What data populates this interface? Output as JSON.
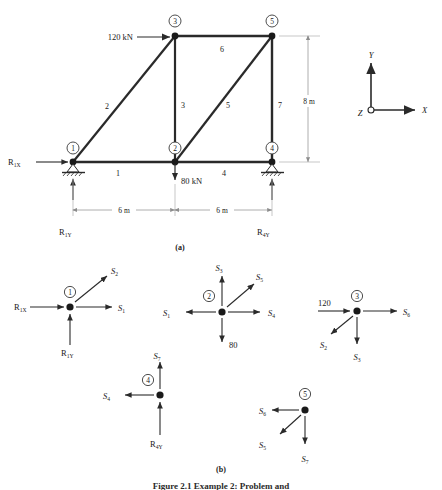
{
  "figure": {
    "panel_a_label": "(a)",
    "panel_b_label": "(b)",
    "caption": "Figure 2.1  Example 2: Problem and"
  },
  "truss": {
    "nodes": [
      {
        "id": "1",
        "label": "1",
        "x": 73,
        "y": 162,
        "support": "pin"
      },
      {
        "id": "2",
        "label": "2",
        "x": 175,
        "y": 162,
        "support": "none"
      },
      {
        "id": "3",
        "label": "3",
        "x": 175,
        "y": 36,
        "support": "none"
      },
      {
        "id": "4",
        "label": "4",
        "x": 272,
        "y": 162,
        "support": "roller"
      },
      {
        "id": "5",
        "label": "5",
        "x": 272,
        "y": 36,
        "support": "none"
      }
    ],
    "members": [
      {
        "label": "1",
        "from": "1",
        "to": "2",
        "lx": 118,
        "ly": 176
      },
      {
        "label": "2",
        "from": "1",
        "to": "3",
        "lx": 107,
        "ly": 109
      },
      {
        "label": "3",
        "from": "2",
        "to": "3",
        "lx": 182,
        "ly": 108
      },
      {
        "label": "4",
        "from": "2",
        "to": "4",
        "lx": 224,
        "ly": 176
      },
      {
        "label": "5",
        "from": "2",
        "to": "5",
        "lx": 227,
        "ly": 108
      },
      {
        "label": "6",
        "from": "3",
        "to": "5",
        "lx": 222,
        "ly": 51
      },
      {
        "label": "7",
        "from": "4",
        "to": "5",
        "lx": 279,
        "ly": 108
      }
    ],
    "loads": [
      {
        "name": "load-120",
        "text": "120 kN",
        "tx": 105,
        "ty": 41
      },
      {
        "name": "load-80",
        "text": "80 kN",
        "tx": 188,
        "ty": 182
      }
    ],
    "reactions": [
      {
        "name": "R1X",
        "base": "R",
        "sub": "1X",
        "tx": 8,
        "ty": 162
      },
      {
        "name": "R1Y",
        "base": "R",
        "sub": "1Y",
        "tx": 60,
        "ty": 232
      },
      {
        "name": "R4Y",
        "base": "R",
        "sub": "4Y",
        "tx": 258,
        "ty": 232
      }
    ],
    "dimensions": [
      {
        "name": "dim-span-left",
        "text": "6 m",
        "tx": 124,
        "ty": 215
      },
      {
        "name": "dim-span-right",
        "text": "6 m",
        "tx": 222,
        "ty": 215
      },
      {
        "name": "dim-height",
        "text": "8 m",
        "tx": 309,
        "ty": 102
      }
    ],
    "axes": {
      "x_label": "X",
      "y_label": "Y",
      "z_label": "Z",
      "origin_x": 371,
      "origin_y": 110
    }
  },
  "fbd": {
    "joints": [
      {
        "id": "1",
        "label": "1",
        "cx": 70,
        "cy": 307,
        "forces": [
          {
            "name": "R1X",
            "base": "R",
            "sub": "1X",
            "dir": "right-in",
            "tx": 15,
            "ty": 304
          },
          {
            "name": "S1",
            "base": "S",
            "sub": "1",
            "dir": "right-out",
            "tx": 119,
            "ty": 309
          },
          {
            "name": "S2",
            "base": "S",
            "sub": "2",
            "dir": "up-right",
            "tx": 114,
            "ty": 272
          },
          {
            "name": "R1Y",
            "base": "R",
            "sub": "1Y",
            "dir": "up-in",
            "tx": 62,
            "ty": 352
          }
        ]
      },
      {
        "id": "2",
        "label": "2",
        "cx": 222,
        "cy": 312,
        "forces": [
          {
            "name": "S1",
            "base": "S",
            "sub": "1",
            "dir": "left-out",
            "tx": 172,
            "ty": 315
          },
          {
            "name": "S4",
            "base": "S",
            "sub": "4",
            "dir": "right-out",
            "tx": 272,
            "ty": 315
          },
          {
            "name": "S3",
            "base": "S",
            "sub": "3",
            "dir": "up-out",
            "tx": 218,
            "ty": 268
          },
          {
            "name": "S5",
            "base": "S",
            "sub": "5",
            "dir": "up-right",
            "tx": 254,
            "ty": 275
          },
          {
            "name": "80",
            "base": "80",
            "sub": "",
            "dir": "down-out",
            "tx": 228,
            "ty": 345
          }
        ]
      },
      {
        "id": "3",
        "label": "3",
        "cx": 357,
        "cy": 311,
        "forces": [
          {
            "name": "120",
            "base": "120",
            "sub": "",
            "dir": "right-in",
            "tx": 314,
            "ty": 303
          },
          {
            "name": "S6",
            "base": "S",
            "sub": "6",
            "dir": "right-out",
            "tx": 404,
            "ty": 314
          },
          {
            "name": "S2",
            "base": "S",
            "sub": "2",
            "dir": "down-left",
            "tx": 322,
            "ty": 341
          },
          {
            "name": "S3",
            "base": "S",
            "sub": "3",
            "dir": "down-out",
            "tx": 353,
            "ty": 355
          }
        ]
      },
      {
        "id": "4",
        "label": "4",
        "cx": 160,
        "cy": 395,
        "forces": [
          {
            "name": "S7",
            "base": "S",
            "sub": "7",
            "dir": "up-out",
            "tx": 157,
            "ty": 357
          },
          {
            "name": "S4",
            "base": "S",
            "sub": "4",
            "dir": "left-out",
            "tx": 111,
            "ty": 398
          },
          {
            "name": "R4Y",
            "base": "R",
            "sub": "4Y",
            "dir": "up-in",
            "tx": 150,
            "ty": 442
          }
        ]
      },
      {
        "id": "5",
        "label": "5",
        "cx": 305,
        "cy": 410,
        "forces": [
          {
            "name": "S6",
            "base": "S",
            "sub": "6",
            "dir": "left-out",
            "tx": 258,
            "ty": 412
          },
          {
            "name": "S5",
            "base": "S",
            "sub": "5",
            "dir": "down-left",
            "tx": 268,
            "ty": 442
          },
          {
            "name": "S7",
            "base": "S",
            "sub": "7",
            "dir": "down-out",
            "tx": 300,
            "ty": 458
          }
        ]
      }
    ]
  },
  "colors": {
    "ink": "#1a1a1a",
    "member": "#2a2a2a",
    "dim_line": "#9a9a9a",
    "arrow": "#3a3a3a",
    "background": "#ffffff"
  }
}
